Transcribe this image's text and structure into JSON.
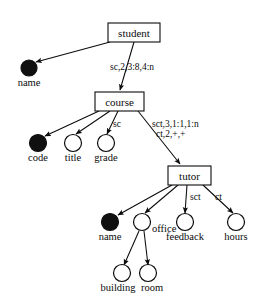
{
  "diagram": {
    "type": "directed-tree",
    "width": 274,
    "height": 303,
    "colors": {
      "stroke": "#0b0b0b",
      "fill_open": "#ffffff",
      "fill_solid": "#101010",
      "background": "#ffffff"
    },
    "nodes": [
      {
        "id": "student",
        "label": "student",
        "shape": "box",
        "x": 108,
        "y": 23,
        "w": 52,
        "h": 19
      },
      {
        "id": "student_name",
        "label": "name",
        "shape": "circle-filled",
        "cx": 29,
        "cy": 68,
        "r": 8,
        "label_x": 29,
        "label_y": 86,
        "label_anchor": "middle"
      },
      {
        "id": "course",
        "label": "course",
        "shape": "box",
        "x": 95,
        "y": 92,
        "w": 49,
        "h": 19
      },
      {
        "id": "code",
        "label": "code",
        "shape": "circle-filled",
        "cx": 38,
        "cy": 143,
        "r": 8.5,
        "label_x": 38,
        "label_y": 161,
        "label_anchor": "middle"
      },
      {
        "id": "title",
        "label": "title",
        "shape": "circle-open",
        "cx": 73,
        "cy": 143,
        "r": 8.5,
        "label_x": 73,
        "label_y": 161,
        "label_anchor": "middle"
      },
      {
        "id": "grade",
        "label": "grade",
        "shape": "circle-open",
        "cx": 106,
        "cy": 143,
        "r": 8.5,
        "label_x": 106,
        "label_y": 161,
        "label_anchor": "middle"
      },
      {
        "id": "tutor",
        "label": "tutor",
        "shape": "box",
        "x": 168,
        "y": 166,
        "w": 43,
        "h": 19
      },
      {
        "id": "tutor_name",
        "label": "name",
        "shape": "circle-filled",
        "cx": 110,
        "cy": 222,
        "r": 8.5,
        "label_x": 110,
        "label_y": 240,
        "label_anchor": "middle"
      },
      {
        "id": "office",
        "label": "office",
        "shape": "circle-open",
        "cx": 142,
        "cy": 222,
        "r": 8.5,
        "label_x": 152,
        "label_y": 232,
        "label_anchor": "start"
      },
      {
        "id": "feedback",
        "label": "feedback",
        "shape": "circle-open",
        "cx": 185,
        "cy": 222,
        "r": 8.5,
        "label_x": 185,
        "label_y": 240,
        "label_anchor": "middle"
      },
      {
        "id": "hours",
        "label": "hours",
        "shape": "circle-open",
        "cx": 236,
        "cy": 222,
        "r": 8.5,
        "label_x": 236,
        "label_y": 240,
        "label_anchor": "middle"
      },
      {
        "id": "building",
        "label": "building",
        "shape": "circle-open",
        "cx": 122,
        "cy": 273,
        "r": 8.5,
        "label_x": 118,
        "label_y": 291,
        "label_anchor": "middle"
      },
      {
        "id": "room",
        "label": "room",
        "shape": "circle-open",
        "cx": 148,
        "cy": 273,
        "r": 8.5,
        "label_x": 152,
        "label_y": 291,
        "label_anchor": "middle"
      }
    ],
    "edges": [
      {
        "id": "student-to-name",
        "from": "student",
        "to": "student_name",
        "x1": 110,
        "y1": 42,
        "x2": 36,
        "y2": 62,
        "label": "",
        "label_x": 0,
        "label_y": 0
      },
      {
        "id": "student-to-course",
        "from": "student",
        "to": "course",
        "x1": 134,
        "y1": 42,
        "x2": 120,
        "y2": 90,
        "label": "sc,2,3:8,4:n",
        "label_x": 110,
        "label_y": 70,
        "label_anchor": "start"
      },
      {
        "id": "course-to-code",
        "from": "course",
        "to": "code",
        "x1": 99,
        "y1": 111,
        "x2": 45,
        "y2": 136,
        "label": "",
        "label_x": 0,
        "label_y": 0
      },
      {
        "id": "course-to-title",
        "from": "course",
        "to": "title",
        "x1": 110,
        "y1": 111,
        "x2": 76,
        "y2": 134,
        "label": "",
        "label_x": 0,
        "label_y": 0
      },
      {
        "id": "course-to-grade",
        "from": "course",
        "to": "grade",
        "x1": 118,
        "y1": 111,
        "x2": 107,
        "y2": 134,
        "label": "sc",
        "label_x": 113,
        "label_y": 127,
        "label_anchor": "start"
      },
      {
        "id": "course-to-tutor",
        "from": "course",
        "to": "tutor",
        "x1": 138,
        "y1": 111,
        "x2": 180,
        "y2": 164,
        "label": "sct,3,1:1,1:n",
        "label2": "ct,2,+,+",
        "label_x": 152,
        "label_y": 127,
        "label2_x": 156,
        "label2_y": 137,
        "label_anchor": "start"
      },
      {
        "id": "tutor-to-name",
        "from": "tutor",
        "to": "tutor_name",
        "x1": 172,
        "y1": 185,
        "x2": 118,
        "y2": 215,
        "label": "",
        "label_x": 0,
        "label_y": 0
      },
      {
        "id": "tutor-to-office",
        "from": "tutor",
        "to": "office",
        "x1": 178,
        "y1": 185,
        "x2": 145,
        "y2": 213,
        "label": "",
        "label_x": 0,
        "label_y": 0
      },
      {
        "id": "tutor-to-feedback",
        "from": "tutor",
        "to": "feedback",
        "x1": 187,
        "y1": 185,
        "x2": 185,
        "y2": 213,
        "label": "sct",
        "label_x": 190,
        "label_y": 200,
        "label_anchor": "start"
      },
      {
        "id": "tutor-to-hours",
        "from": "tutor",
        "to": "hours",
        "x1": 203,
        "y1": 185,
        "x2": 233,
        "y2": 213,
        "label": "ct",
        "label_x": 215,
        "label_y": 200,
        "label_anchor": "start"
      },
      {
        "id": "office-to-building",
        "from": "office",
        "to": "building",
        "x1": 139,
        "y1": 231,
        "x2": 124,
        "y2": 265,
        "label": "",
        "label_x": 0,
        "label_y": 0
      },
      {
        "id": "office-to-room",
        "from": "office",
        "to": "room",
        "x1": 144,
        "y1": 231,
        "x2": 148,
        "y2": 265,
        "label": "",
        "label_x": 0,
        "label_y": 0
      }
    ]
  }
}
